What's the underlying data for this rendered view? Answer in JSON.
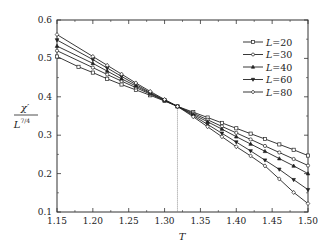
{
  "chart_data": {
    "type": "line",
    "title": "",
    "xlabel": "T",
    "ylabel": "χ'/L^{7/4}",
    "ylabel_num": "χ′",
    "ylabel_den": "L",
    "ylabel_den_sup": "7/4",
    "xlim": [
      1.15,
      1.5
    ],
    "ylim": [
      0.1,
      0.6
    ],
    "xticks": [
      "1.15",
      "1.20",
      "1.25",
      "1.30",
      "1.35",
      "1.40",
      "1.45",
      "1.50"
    ],
    "yticks": [
      "0.1",
      "0.2",
      "0.3",
      "0.4",
      "0.5",
      "0.6"
    ],
    "crossing_T": 1.318,
    "legend_position": "upper right",
    "series": [
      {
        "name": "L=20",
        "label": "L",
        "value": "=20",
        "marker": "square",
        "x": [
          1.15,
          1.18,
          1.2,
          1.22,
          1.24,
          1.26,
          1.28,
          1.3,
          1.318,
          1.34,
          1.36,
          1.38,
          1.4,
          1.42,
          1.44,
          1.46,
          1.48,
          1.5
        ],
        "y": [
          0.505,
          0.478,
          0.463,
          0.447,
          0.432,
          0.418,
          0.404,
          0.389,
          0.375,
          0.36,
          0.346,
          0.332,
          0.318,
          0.304,
          0.29,
          0.276,
          0.262,
          0.247
        ]
      },
      {
        "name": "L=30",
        "label": "L",
        "value": "=30",
        "marker": "circle",
        "x": [
          1.15,
          1.2,
          1.22,
          1.24,
          1.26,
          1.28,
          1.3,
          1.318,
          1.34,
          1.36,
          1.38,
          1.4,
          1.42,
          1.44,
          1.46,
          1.48,
          1.5
        ],
        "y": [
          0.52,
          0.476,
          0.458,
          0.441,
          0.424,
          0.407,
          0.39,
          0.375,
          0.357,
          0.34,
          0.323,
          0.306,
          0.289,
          0.272,
          0.255,
          0.238,
          0.221
        ]
      },
      {
        "name": "L=40",
        "label": "L",
        "value": "=40",
        "marker": "triangle-up",
        "x": [
          1.15,
          1.2,
          1.22,
          1.24,
          1.26,
          1.28,
          1.3,
          1.318,
          1.34,
          1.36,
          1.38,
          1.4,
          1.42,
          1.44,
          1.46,
          1.48,
          1.5
        ],
        "y": [
          0.532,
          0.487,
          0.467,
          0.447,
          0.428,
          0.409,
          0.391,
          0.375,
          0.354,
          0.335,
          0.316,
          0.296,
          0.277,
          0.258,
          0.239,
          0.22,
          0.2
        ]
      },
      {
        "name": "L=60",
        "label": "L",
        "value": "=60",
        "marker": "triangle-down",
        "x": [
          1.15,
          1.2,
          1.22,
          1.24,
          1.26,
          1.28,
          1.3,
          1.318,
          1.34,
          1.36,
          1.38,
          1.4,
          1.42,
          1.44,
          1.46,
          1.48,
          1.5
        ],
        "y": [
          0.548,
          0.497,
          0.475,
          0.453,
          0.432,
          0.411,
          0.392,
          0.375,
          0.351,
          0.328,
          0.305,
          0.282,
          0.259,
          0.235,
          0.211,
          0.184,
          0.158
        ]
      },
      {
        "name": "L=80",
        "label": "L",
        "value": "=80",
        "marker": "diamond",
        "x": [
          1.15,
          1.2,
          1.22,
          1.24,
          1.26,
          1.28,
          1.3,
          1.318,
          1.34,
          1.36,
          1.38,
          1.4,
          1.42,
          1.44,
          1.46,
          1.48,
          1.5
        ],
        "y": [
          0.562,
          0.505,
          0.482,
          0.459,
          0.436,
          0.414,
          0.393,
          0.375,
          0.348,
          0.322,
          0.296,
          0.27,
          0.246,
          0.22,
          0.186,
          0.151,
          0.122
        ]
      }
    ]
  },
  "colors": {
    "line": "#222222",
    "axis": "#333333",
    "background": "#ffffff",
    "guide": "#777777"
  }
}
